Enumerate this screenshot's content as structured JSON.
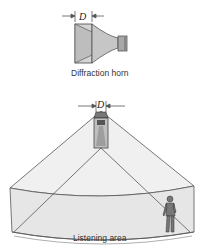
{
  "figure": {
    "top": {
      "title": "Diffraction horn",
      "dimension_label": "D"
    },
    "bottom": {
      "dimension_label": "D",
      "area_label": "Listening area"
    }
  },
  "colors": {
    "horn_fill": "#c9c9c9",
    "horn_dark": "#9a9a9a",
    "stroke": "#444444",
    "area_fill": "#ececec",
    "wall_fill": "#dcdcdc"
  }
}
